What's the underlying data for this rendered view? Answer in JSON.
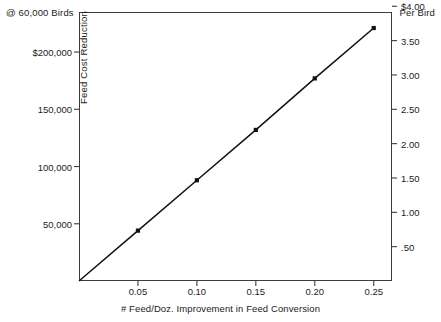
{
  "chart_data": {
    "type": "line",
    "title": "",
    "subtitle": "",
    "annotations": {
      "top_left": "@ 60,000 Birds",
      "top_right": "Per Bird"
    },
    "xlabel": "# Feed/Doz. Improvement in Feed Conversion",
    "ylabel": "Feed Cost Reduction",
    "y2label": "Per Bird",
    "x": [
      0.05,
      0.1,
      0.15,
      0.2,
      0.25
    ],
    "values": [
      44000,
      88000,
      132000,
      177000,
      221000
    ],
    "values_per_bird": [
      0.73,
      1.47,
      2.2,
      2.95,
      3.68
    ],
    "series": [
      {
        "name": "Feed Cost Reduction",
        "values": [
          44000,
          88000,
          132000,
          177000,
          221000
        ]
      }
    ],
    "xlim": [
      0.0,
      0.2655
    ],
    "ylim": [
      0,
      235000
    ],
    "y2lim": [
      0,
      3.9167
    ],
    "grid": false,
    "legend": false,
    "legend_position": "none",
    "marker": "square",
    "line_color": "#111111",
    "frame_color": "#3c3c3c",
    "background": "#ffffff",
    "xticks": [
      {
        "value": 0.05,
        "label": "0.05"
      },
      {
        "value": 0.1,
        "label": "0.10"
      },
      {
        "value": 0.15,
        "label": "0.15"
      },
      {
        "value": 0.2,
        "label": "0.20"
      },
      {
        "value": 0.25,
        "label": "0.25"
      }
    ],
    "yticks": [
      {
        "value": 200000,
        "label": "$200,000"
      },
      {
        "value": 150000,
        "label": "150,000"
      },
      {
        "value": 100000,
        "label": "100,000"
      },
      {
        "value": 50000,
        "label": "50,000"
      }
    ],
    "y2ticks": [
      {
        "value": 4.0,
        "label": "$4.00"
      },
      {
        "value": 3.5,
        "label": "3.50"
      },
      {
        "value": 3.0,
        "label": "3.00"
      },
      {
        "value": 2.5,
        "label": "2.50"
      },
      {
        "value": 2.0,
        "label": "2.00"
      },
      {
        "value": 1.5,
        "label": "1.50"
      },
      {
        "value": 1.0,
        "label": "1.00"
      },
      {
        "value": 0.5,
        "label": ".50"
      }
    ]
  }
}
